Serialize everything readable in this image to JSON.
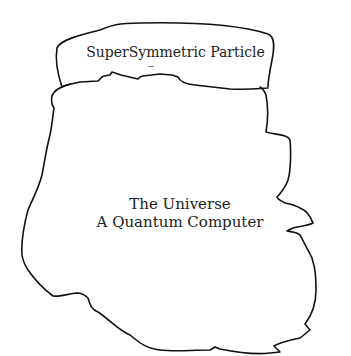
{
  "diagram": {
    "particle": {
      "label": "SuperSymmetric Particle"
    },
    "universe": {
      "line1": "The Universe",
      "line2": "A Quantum Computer"
    },
    "colors": {
      "stroke": "#111111",
      "text": "#222222",
      "background": "#ffffff"
    }
  }
}
